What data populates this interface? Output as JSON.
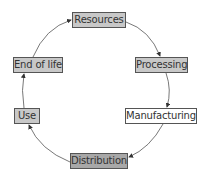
{
  "diagram": {
    "type": "cycle",
    "nodes": [
      {
        "id": "resources",
        "label": "Resources",
        "fill": "#c8c8c8"
      },
      {
        "id": "processing",
        "label": "Processing",
        "fill": "#c8c8c8"
      },
      {
        "id": "manufacturing",
        "label": "Manufacturing",
        "fill": "#ffffff"
      },
      {
        "id": "distribution",
        "label": "Distribution",
        "fill": "#a8a8a8"
      },
      {
        "id": "use",
        "label": "Use",
        "fill": "#c8c8c8"
      },
      {
        "id": "end_of_life",
        "label": "End of life",
        "fill": "#c8c8c8"
      }
    ],
    "edges": [
      {
        "from": "resources",
        "to": "processing"
      },
      {
        "from": "processing",
        "to": "manufacturing"
      },
      {
        "from": "manufacturing",
        "to": "distribution"
      },
      {
        "from": "distribution",
        "to": "use"
      },
      {
        "from": "use",
        "to": "end_of_life"
      },
      {
        "from": "end_of_life",
        "to": "resources"
      }
    ]
  }
}
